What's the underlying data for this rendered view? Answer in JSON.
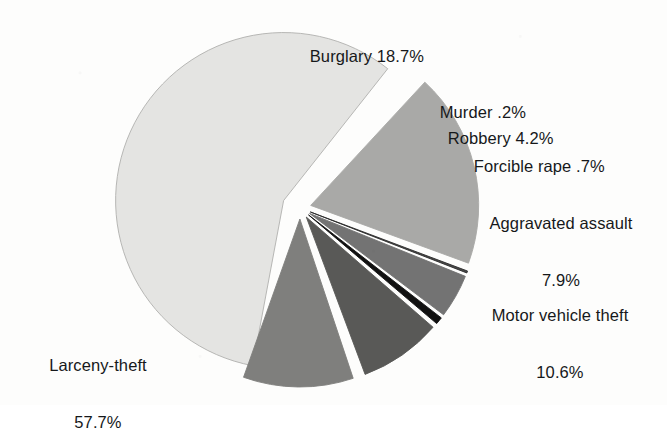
{
  "chart_data": {
    "type": "pie",
    "title": "",
    "subtitle": "",
    "xlabel": "",
    "ylabel": "",
    "legend_position": "none",
    "grid": false,
    "units": "percent",
    "total": 100.0,
    "categories": [
      "Larceny-theft",
      "Burglary",
      "Murder",
      "Robbery",
      "Forcible rape",
      "Aggravated assault",
      "Motor vehicle theft"
    ],
    "values": [
      57.7,
      18.7,
      0.2,
      4.2,
      0.7,
      7.9,
      10.6
    ],
    "slices": [
      {
        "name": "larceny-theft",
        "label": "Larceny-theft",
        "value_label": "57.7%",
        "value": 57.7,
        "color": "#e4e4e2",
        "stroke": "#b0b0ae",
        "start_angle": 100.6,
        "end_angle": 308.3,
        "explode": 18,
        "label_text_line1": "Larceny-theft",
        "label_text_line2": "57.7%"
      },
      {
        "name": "burglary",
        "label": "Burglary",
        "value_label": "18.7%",
        "value": 18.7,
        "color": "#a9a9a7",
        "stroke": "#a9a9a7",
        "start_angle": 312.8,
        "end_angle": 380.1,
        "explode": 11,
        "label_text_line1": "Burglary 18.7%",
        "label_text_line2": ""
      },
      {
        "name": "murder",
        "label": "Murder",
        "value_label": ".2%",
        "value": 0.2,
        "color": "#4a4a4a",
        "stroke": "#2a2a2a",
        "start_angle": 380.6,
        "end_angle": 381.3,
        "explode": 11,
        "label_text_line1": "Murder .2%",
        "label_text_line2": ""
      },
      {
        "name": "robbery",
        "label": "Robbery",
        "value_label": "4.2%",
        "value": 4.2,
        "color": "#737373",
        "stroke": "#737373",
        "start_angle": 382.0,
        "end_angle": 397.1,
        "explode": 11,
        "label_text_line1": "Robbery 4.2%",
        "label_text_line2": ""
      },
      {
        "name": "forcible-rape",
        "label": "Forcible rape",
        "value_label": ".7%",
        "value": 0.7,
        "color": "#111111",
        "stroke": "#111111",
        "start_angle": 397.8,
        "end_angle": 400.3,
        "explode": 11,
        "label_text_line1": "Forcible rape .7%",
        "label_text_line2": ""
      },
      {
        "name": "aggravated-assault",
        "label": "Aggravated assault",
        "value_label": "7.9%",
        "value": 7.9,
        "color": "#595957",
        "stroke": "#595957",
        "start_angle": 401.0,
        "end_angle": 429.5,
        "explode": 11,
        "label_text_line1": "Aggravated assault",
        "label_text_line2": "7.9%"
      },
      {
        "name": "motor-vehicle-theft",
        "label": "Motor vehicle theft",
        "value_label": "10.6%",
        "value": 10.6,
        "color": "#7f7f7d",
        "stroke": "#7f7f7d",
        "start_angle": 431.5,
        "end_angle": 469.6,
        "explode": 11,
        "label_text_line1": "Motor vehicle theft",
        "label_text_line2": "10.6%"
      }
    ],
    "labels": {
      "burglary": "Burglary 18.7%",
      "murder": "Murder .2%",
      "robbery": "Robbery 4.2%",
      "forcible_rape": "Forcible rape .7%",
      "aggravated_assault_line1": "Aggravated assault",
      "aggravated_assault_line2": "7.9%",
      "motor_vehicle_theft_line1": "Motor vehicle theft",
      "motor_vehicle_theft_line2": "10.6%",
      "larceny_theft_line1": "Larceny-theft",
      "larceny_theft_line2": "57.7%"
    }
  },
  "colors": {
    "background": "#fdfdfc",
    "text": "#16181a",
    "larceny_theft": "#e4e4e2",
    "burglary": "#a9a9a7",
    "murder": "#4a4a4a",
    "robbery": "#737373",
    "forcible_rape": "#111111",
    "aggravated_assault": "#595957",
    "motor_vehicle_theft": "#7f7f7d"
  },
  "geometry": {
    "center_x": 300,
    "center_y": 208,
    "radius": 168
  }
}
